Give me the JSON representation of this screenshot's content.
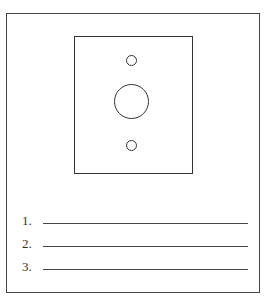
{
  "diagram": {
    "title": "",
    "plate": {
      "holes": [
        "small-top-hole",
        "large-center-hole",
        "small-bottom-hole"
      ]
    },
    "answer_lines": [
      {
        "number": "1.",
        "value": ""
      },
      {
        "number": "2.",
        "value": ""
      },
      {
        "number": "3.",
        "value": ""
      }
    ]
  }
}
